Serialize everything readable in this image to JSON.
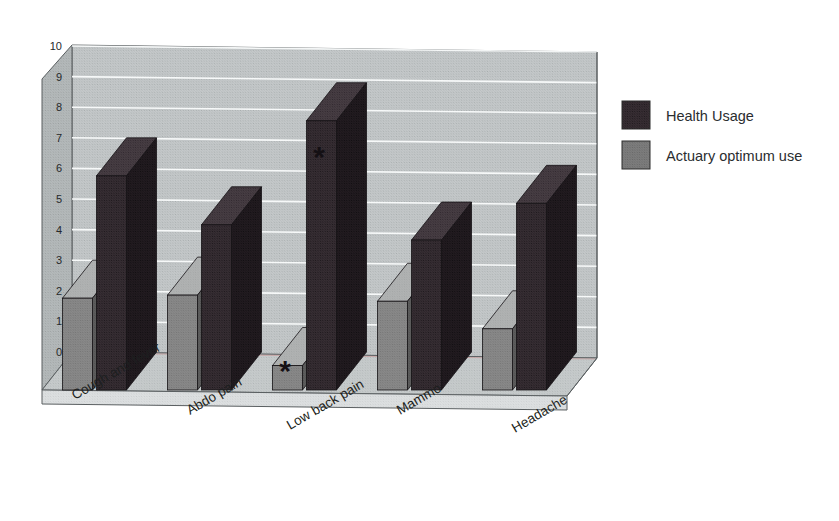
{
  "chart_data": {
    "type": "bar",
    "title": "",
    "subtitle": "",
    "xlabel": "",
    "ylabel": "",
    "ylim": [
      0,
      10
    ],
    "ytick_step": 1,
    "yticks": [
      "0",
      "1",
      "2",
      "3",
      "4",
      "5",
      "6",
      "7",
      "8",
      "9",
      "10"
    ],
    "grid": true,
    "grid_axis": "y",
    "three_d": true,
    "legend_position": "right",
    "categories": [
      "Cough and fever",
      "Abdo pain",
      "Low back pain",
      "Mammo",
      "Headache"
    ],
    "series": [
      {
        "name": "Health Usage",
        "color": "#3a3036",
        "values": [
          7.0,
          5.4,
          8.8,
          4.9,
          6.1
        ]
      },
      {
        "name": "Actuary optimum use",
        "color": "#8b8b8b",
        "values": [
          3.0,
          3.1,
          0.8,
          2.9,
          2.0
        ]
      }
    ],
    "series_draw_order": [
      "Actuary optimum use",
      "Health Usage"
    ],
    "annotations": [
      {
        "text": "*",
        "series": "Actuary optimum use",
        "category": "Low back pain"
      },
      {
        "text": "*",
        "series": "Health Usage",
        "category": "Low back pain"
      }
    ]
  },
  "legend": {
    "items": [
      {
        "label": "Health Usage",
        "swatch_color": "#3a3036"
      },
      {
        "label": "Actuary optimum use",
        "swatch_color": "#7f7f7f"
      }
    ]
  },
  "palette": {
    "back_wall": "#c7cbcc",
    "left_wall": "#b7bcbd",
    "floor_top": "#c9cdce",
    "floor_front": "#dfe2e3",
    "gridline": "#fafcfc",
    "baseline_accent": "#c8a0a0",
    "outline": "#5a5f61",
    "dark_bar_face": "#3a3036",
    "dark_bar_side": "#241d22",
    "dark_bar_top": "#4a4046",
    "gray_bar_face": "#8b8b8b",
    "gray_bar_side": "#5f5f5f",
    "gray_bar_top": "#b2b4b4",
    "text": "#1d1f20",
    "background": "#ffffff"
  }
}
